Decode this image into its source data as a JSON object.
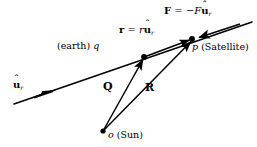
{
  "figure": {
    "type": "vector-diagram",
    "background_color": "#ffffff",
    "stroke_color": "#000000"
  },
  "points": [
    {
      "id": "o",
      "name": "Sun",
      "label_italic": "o",
      "label_paren": "(Sun)",
      "x": 103,
      "y": 131
    },
    {
      "id": "q",
      "name": "earth",
      "label_italic": "q",
      "label_paren": "(earth)",
      "x": 144,
      "y": 57
    },
    {
      "id": "p",
      "name": "Satellite",
      "label_italic": "p",
      "label_paren": "(Satellite)",
      "x": 192,
      "y": 39
    }
  ],
  "labels": {
    "force": {
      "vector": "F",
      "equals": "=",
      "minus": "−",
      "magnitude": "F",
      "unit_vector": "u",
      "hat": "ˆ",
      "subscript": "r"
    },
    "separation": {
      "vector": "r",
      "equals": "=",
      "magnitude": "r",
      "unit_vector": "u",
      "hat": "ˆ",
      "subscript": "r"
    },
    "unit_vector_line": {
      "unit_vector": "u",
      "hat": "ˆ",
      "subscript": "r"
    },
    "earth_point": {
      "paren": "(earth)",
      "symbol": "q"
    },
    "satellite_point": {
      "symbol": "p",
      "paren": "(Satellite)"
    },
    "sun_point": {
      "symbol": "o",
      "paren": "(Sun)"
    },
    "vector_Q": "Q",
    "vector_R": "R"
  },
  "vectors": [
    {
      "id": "Q",
      "label": "Q",
      "from": "o",
      "to": "q",
      "x1": 103,
      "y1": 131,
      "x2": 144,
      "y2": 57,
      "arrow": "end"
    },
    {
      "id": "R",
      "label": "R",
      "from": "o",
      "to": "p",
      "x1": 103,
      "y1": 131,
      "x2": 192,
      "y2": 39,
      "arrow": "end"
    },
    {
      "id": "r",
      "label": "r",
      "from": "q",
      "to": "p",
      "x1": 144,
      "y1": 57,
      "x2": 192,
      "y2": 39,
      "arrow": "end"
    },
    {
      "id": "F",
      "label": "F",
      "from": "line-right",
      "to": "p",
      "x1": 240,
      "y1": 24,
      "x2": 197,
      "y2": 38,
      "arrow": "end"
    }
  ],
  "lines": [
    {
      "id": "uhat-axis",
      "x1": 14,
      "y1": 104,
      "x2": 252,
      "y2": 22,
      "arrow_at": {
        "x": 48,
        "y": 92,
        "direction": "right"
      }
    }
  ]
}
